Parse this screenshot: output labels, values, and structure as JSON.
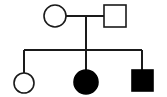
{
  "diagram": {
    "type": "pedigree",
    "background_color": "#ffffff",
    "stroke_color": "#1a1a1a",
    "fill_affected_color": "#000000",
    "fill_unaffected_color": "#ffffff",
    "canvas": {
      "width": 167,
      "height": 97
    }
  },
  "legend": {
    "circle_meaning": "female",
    "square_meaning": "male",
    "filled_meaning": "affected",
    "open_meaning": "unaffected"
  },
  "generations": [
    {
      "id": "generation-1",
      "label": "I",
      "individuals": [
        {
          "id": "I-1",
          "shape": "circle",
          "sex": "female",
          "status": "unaffected",
          "filled": false,
          "cx": 55,
          "cy": 16,
          "r": 11
        },
        {
          "id": "I-2",
          "shape": "square",
          "sex": "male",
          "status": "unaffected",
          "filled": false,
          "x": 104,
          "y": 5,
          "size": 22
        }
      ]
    },
    {
      "id": "generation-2",
      "label": "II",
      "individuals": [
        {
          "id": "II-1",
          "shape": "circle",
          "sex": "female",
          "status": "unaffected",
          "filled": false,
          "cx": 24,
          "cy": 83,
          "r": 10
        },
        {
          "id": "II-2",
          "shape": "circle",
          "sex": "female",
          "status": "affected",
          "filled": true,
          "cx": 86,
          "cy": 82,
          "r": 12
        },
        {
          "id": "II-3",
          "shape": "square",
          "sex": "male",
          "status": "affected",
          "filled": true,
          "x": 132,
          "y": 70,
          "size": 21
        }
      ]
    }
  ],
  "connectors": {
    "mating_line": {
      "x1": 66,
      "y1": 16,
      "x2": 104,
      "y2": 16
    },
    "descent_line": {
      "x1": 86,
      "y1": 16,
      "x2": 86,
      "y2": 50
    },
    "sibship_line": {
      "x1": 24,
      "y1": 50,
      "x2": 142,
      "y2": 50
    },
    "child_drop_lines": [
      {
        "id": "drop-II-1",
        "x1": 24,
        "y1": 50,
        "x2": 24,
        "y2": 73
      },
      {
        "id": "drop-II-2",
        "x1": 86,
        "y1": 50,
        "x2": 86,
        "y2": 70
      },
      {
        "id": "drop-II-3",
        "x1": 142,
        "y1": 50,
        "x2": 142,
        "y2": 70
      }
    ]
  }
}
